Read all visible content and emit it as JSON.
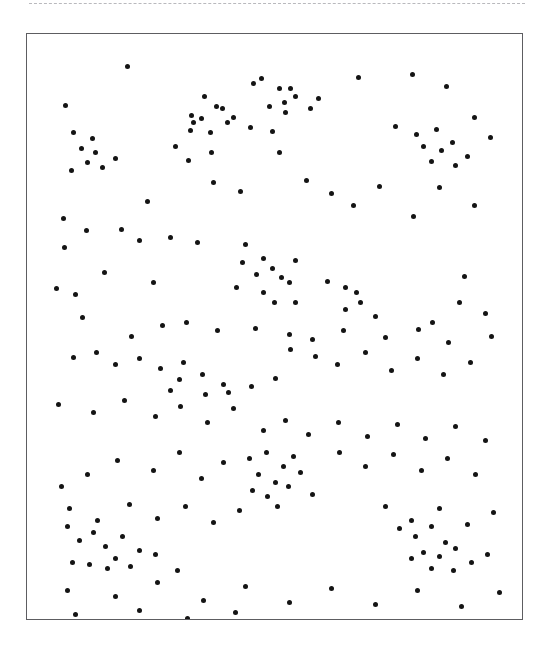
{
  "page": {
    "background_color": "#ffffff",
    "width": 552,
    "height": 663
  },
  "top_rule": {
    "style": "dashed",
    "color": "#b9b9bd"
  },
  "stimulus": {
    "title": "",
    "frame": {
      "x": 26,
      "y": 33,
      "width": 497,
      "height": 587,
      "border_color": "#5d5d61",
      "fill_color": "#ffffff"
    },
    "dot": {
      "color": "#141414",
      "diameter_px": 5,
      "shape": "circle"
    },
    "dot_count": 192
  },
  "chart_data": {
    "type": "scatter",
    "title": "",
    "xlabel": "",
    "ylabel": "",
    "xlim": [
      0,
      497
    ],
    "ylim": [
      0,
      587
    ],
    "grid": false,
    "legend": "none",
    "marker": "filled-circle",
    "marker_color": "#141414",
    "marker_size_px": 5,
    "note": "Coordinates are pixels relative to the inner top-left of the bordered frame; y increases downward.",
    "points": [
      [
        100,
        31
      ],
      [
        166,
        88
      ],
      [
        224,
        38
      ],
      [
        237,
        58
      ],
      [
        265,
        47
      ],
      [
        309,
        42
      ],
      [
        331,
        76
      ],
      [
        360,
        32
      ],
      [
        419,
        52
      ],
      [
        38,
        71
      ],
      [
        130,
        71
      ],
      [
        152,
        82
      ],
      [
        176,
        66
      ],
      [
        193,
        79
      ],
      [
        222,
        60
      ],
      [
        244,
        67
      ],
      [
        269,
        56
      ],
      [
        284,
        72
      ],
      [
        48,
        102
      ],
      [
        67,
        97
      ],
      [
        90,
        108
      ],
      [
        140,
        95
      ],
      [
        163,
        102
      ],
      [
        205,
        93
      ],
      [
        230,
        106
      ],
      [
        255,
        98
      ],
      [
        285,
        87
      ],
      [
        299,
        104
      ],
      [
        334,
        100
      ],
      [
        378,
        97
      ],
      [
        425,
        95
      ],
      [
        450,
        108
      ],
      [
        35,
        125
      ],
      [
        57,
        118
      ],
      [
        75,
        131
      ],
      [
        102,
        123
      ],
      [
        118,
        140
      ],
      [
        155,
        128
      ],
      [
        178,
        119
      ],
      [
        196,
        137
      ],
      [
        214,
        127
      ],
      [
        243,
        119
      ],
      [
        266,
        135
      ],
      [
        292,
        126
      ],
      [
        317,
        141
      ],
      [
        347,
        121
      ],
      [
        370,
        139
      ],
      [
        397,
        130
      ],
      [
        421,
        144
      ],
      [
        444,
        122
      ],
      [
        30,
        160
      ],
      [
        51,
        173
      ],
      [
        79,
        156
      ],
      [
        105,
        168
      ],
      [
        127,
        155
      ],
      [
        148,
        172
      ],
      [
        170,
        158
      ],
      [
        192,
        177
      ],
      [
        219,
        162
      ],
      [
        240,
        180
      ],
      [
        264,
        165
      ],
      [
        287,
        182
      ],
      [
        312,
        160
      ],
      [
        336,
        178
      ],
      [
        358,
        163
      ],
      [
        383,
        180
      ],
      [
        406,
        161
      ],
      [
        430,
        178
      ],
      [
        457,
        166
      ],
      [
        470,
        190
      ],
      [
        36,
        197
      ],
      [
        62,
        210
      ],
      [
        88,
        196
      ],
      [
        111,
        214
      ],
      [
        134,
        199
      ],
      [
        160,
        216
      ],
      [
        183,
        200
      ],
      [
        206,
        219
      ],
      [
        228,
        203
      ],
      [
        253,
        220
      ],
      [
        276,
        205
      ],
      [
        300,
        222
      ],
      [
        325,
        207
      ],
      [
        349,
        224
      ],
      [
        372,
        209
      ],
      [
        396,
        226
      ],
      [
        420,
        211
      ],
      [
        444,
        228
      ],
      [
        466,
        213
      ],
      [
        30,
        244
      ],
      [
        55,
        236
      ],
      [
        80,
        250
      ],
      [
        103,
        239
      ],
      [
        127,
        253
      ],
      [
        150,
        241
      ],
      [
        172,
        255
      ],
      [
        197,
        243
      ],
      [
        220,
        257
      ],
      [
        245,
        245
      ],
      [
        268,
        259
      ],
      [
        291,
        247
      ],
      [
        315,
        261
      ],
      [
        339,
        249
      ],
      [
        362,
        263
      ],
      [
        386,
        251
      ],
      [
        410,
        265
      ],
      [
        434,
        253
      ],
      [
        458,
        267
      ],
      [
        34,
        282
      ],
      [
        58,
        295
      ],
      [
        82,
        284
      ],
      [
        106,
        297
      ],
      [
        130,
        286
      ],
      [
        154,
        299
      ],
      [
        178,
        288
      ],
      [
        201,
        301
      ],
      [
        225,
        290
      ],
      [
        249,
        303
      ],
      [
        273,
        292
      ],
      [
        296,
        305
      ],
      [
        320,
        294
      ],
      [
        344,
        307
      ],
      [
        368,
        296
      ],
      [
        392,
        309
      ],
      [
        416,
        298
      ],
      [
        440,
        311
      ],
      [
        463,
        300
      ],
      [
        32,
        330
      ],
      [
        56,
        343
      ],
      [
        80,
        332
      ],
      [
        104,
        345
      ],
      [
        128,
        334
      ],
      [
        152,
        347
      ],
      [
        176,
        336
      ],
      [
        200,
        349
      ],
      [
        224,
        338
      ],
      [
        247,
        351
      ],
      [
        271,
        340
      ],
      [
        295,
        353
      ],
      [
        319,
        342
      ],
      [
        343,
        355
      ],
      [
        367,
        344
      ],
      [
        391,
        357
      ],
      [
        415,
        346
      ],
      [
        439,
        359
      ],
      [
        462,
        348
      ],
      [
        30,
        380
      ],
      [
        54,
        393
      ],
      [
        78,
        382
      ],
      [
        102,
        395
      ],
      [
        126,
        384
      ],
      [
        150,
        397
      ],
      [
        174,
        386
      ],
      [
        198,
        399
      ],
      [
        222,
        388
      ],
      [
        246,
        401
      ],
      [
        270,
        390
      ],
      [
        293,
        403
      ],
      [
        317,
        392
      ],
      [
        341,
        405
      ],
      [
        365,
        394
      ],
      [
        389,
        407
      ],
      [
        413,
        396
      ],
      [
        437,
        409
      ],
      [
        461,
        398
      ],
      [
        34,
        432
      ],
      [
        58,
        445
      ],
      [
        82,
        434
      ],
      [
        106,
        447
      ],
      [
        130,
        436
      ],
      [
        154,
        449
      ],
      [
        178,
        438
      ],
      [
        202,
        451
      ],
      [
        226,
        440
      ],
      [
        250,
        453
      ],
      [
        274,
        442
      ],
      [
        297,
        455
      ],
      [
        321,
        444
      ],
      [
        345,
        457
      ],
      [
        369,
        446
      ],
      [
        393,
        459
      ],
      [
        417,
        448
      ],
      [
        441,
        461
      ],
      [
        464,
        450
      ],
      [
        36,
        488
      ],
      [
        60,
        501
      ],
      [
        84,
        490
      ],
      [
        108,
        503
      ],
      [
        132,
        492
      ],
      [
        156,
        505
      ],
      [
        180,
        494
      ],
      [
        204,
        507
      ],
      [
        228,
        496
      ],
      [
        252,
        509
      ],
      [
        276,
        498
      ],
      [
        300,
        511
      ],
      [
        324,
        500
      ],
      [
        348,
        513
      ],
      [
        372,
        502
      ],
      [
        396,
        515
      ],
      [
        420,
        504
      ],
      [
        444,
        517
      ],
      [
        467,
        506
      ],
      [
        34,
        540
      ],
      [
        58,
        553
      ],
      [
        82,
        542
      ],
      [
        106,
        555
      ],
      [
        130,
        544
      ],
      [
        154,
        557
      ],
      [
        178,
        546
      ],
      [
        202,
        559
      ],
      [
        226,
        548
      ],
      [
        250,
        561
      ],
      [
        274,
        550
      ],
      [
        298,
        563
      ],
      [
        322,
        552
      ],
      [
        346,
        565
      ],
      [
        370,
        554
      ],
      [
        394,
        567
      ],
      [
        418,
        556
      ],
      [
        442,
        569
      ],
      [
        466,
        558
      ]
    ],
    "rendered_points": [
      [
        100,
        32
      ],
      [
        166,
        88
      ],
      [
        38,
        71
      ],
      [
        226,
        49
      ],
      [
        234,
        44
      ],
      [
        252,
        54
      ],
      [
        268,
        62
      ],
      [
        242,
        72
      ],
      [
        257,
        68
      ],
      [
        291,
        64
      ],
      [
        258,
        78
      ],
      [
        283,
        74
      ],
      [
        263,
        54
      ],
      [
        331,
        43
      ],
      [
        385,
        40
      ],
      [
        419,
        52
      ],
      [
        177,
        62
      ],
      [
        195,
        74
      ],
      [
        164,
        81
      ],
      [
        174,
        84
      ],
      [
        189,
        72
      ],
      [
        163,
        96
      ],
      [
        183,
        98
      ],
      [
        200,
        88
      ],
      [
        206,
        83
      ],
      [
        46,
        98
      ],
      [
        65,
        104
      ],
      [
        54,
        114
      ],
      [
        68,
        118
      ],
      [
        60,
        128
      ],
      [
        44,
        136
      ],
      [
        75,
        133
      ],
      [
        88,
        124
      ],
      [
        148,
        112
      ],
      [
        161,
        126
      ],
      [
        184,
        118
      ],
      [
        223,
        93
      ],
      [
        245,
        97
      ],
      [
        252,
        118
      ],
      [
        368,
        92
      ],
      [
        389,
        100
      ],
      [
        409,
        95
      ],
      [
        396,
        112
      ],
      [
        414,
        116
      ],
      [
        425,
        108
      ],
      [
        404,
        127
      ],
      [
        428,
        131
      ],
      [
        440,
        122
      ],
      [
        447,
        83
      ],
      [
        463,
        103
      ],
      [
        120,
        167
      ],
      [
        186,
        148
      ],
      [
        213,
        157
      ],
      [
        279,
        146
      ],
      [
        304,
        159
      ],
      [
        326,
        171
      ],
      [
        352,
        152
      ],
      [
        386,
        182
      ],
      [
        412,
        153
      ],
      [
        447,
        171
      ],
      [
        36,
        184
      ],
      [
        59,
        196
      ],
      [
        94,
        195
      ],
      [
        37,
        213
      ],
      [
        112,
        206
      ],
      [
        143,
        203
      ],
      [
        170,
        208
      ],
      [
        218,
        210
      ],
      [
        236,
        224
      ],
      [
        245,
        234
      ],
      [
        254,
        243
      ],
      [
        229,
        240
      ],
      [
        215,
        228
      ],
      [
        209,
        253
      ],
      [
        236,
        258
      ],
      [
        262,
        248
      ],
      [
        268,
        226
      ],
      [
        247,
        268
      ],
      [
        268,
        268
      ],
      [
        77,
        238
      ],
      [
        126,
        248
      ],
      [
        48,
        260
      ],
      [
        29,
        254
      ],
      [
        300,
        247
      ],
      [
        318,
        253
      ],
      [
        329,
        258
      ],
      [
        318,
        275
      ],
      [
        333,
        268
      ],
      [
        348,
        282
      ],
      [
        437,
        242
      ],
      [
        432,
        268
      ],
      [
        405,
        288
      ],
      [
        458,
        279
      ],
      [
        55,
        283
      ],
      [
        135,
        291
      ],
      [
        104,
        302
      ],
      [
        159,
        288
      ],
      [
        190,
        296
      ],
      [
        228,
        294
      ],
      [
        262,
        300
      ],
      [
        285,
        305
      ],
      [
        316,
        296
      ],
      [
        358,
        303
      ],
      [
        391,
        295
      ],
      [
        421,
        308
      ],
      [
        464,
        302
      ],
      [
        46,
        323
      ],
      [
        69,
        318
      ],
      [
        88,
        330
      ],
      [
        112,
        324
      ],
      [
        133,
        334
      ],
      [
        156,
        328
      ],
      [
        152,
        345
      ],
      [
        175,
        340
      ],
      [
        196,
        350
      ],
      [
        143,
        356
      ],
      [
        178,
        360
      ],
      [
        201,
        358
      ],
      [
        224,
        352
      ],
      [
        248,
        344
      ],
      [
        263,
        315
      ],
      [
        288,
        322
      ],
      [
        310,
        330
      ],
      [
        338,
        318
      ],
      [
        364,
        336
      ],
      [
        390,
        324
      ],
      [
        416,
        340
      ],
      [
        443,
        328
      ],
      [
        31,
        370
      ],
      [
        66,
        378
      ],
      [
        97,
        366
      ],
      [
        128,
        382
      ],
      [
        153,
        372
      ],
      [
        180,
        388
      ],
      [
        206,
        374
      ],
      [
        236,
        396
      ],
      [
        258,
        386
      ],
      [
        281,
        400
      ],
      [
        311,
        388
      ],
      [
        340,
        402
      ],
      [
        370,
        390
      ],
      [
        398,
        404
      ],
      [
        428,
        392
      ],
      [
        458,
        406
      ],
      [
        222,
        424
      ],
      [
        239,
        418
      ],
      [
        256,
        432
      ],
      [
        266,
        422
      ],
      [
        231,
        440
      ],
      [
        248,
        448
      ],
      [
        225,
        456
      ],
      [
        240,
        462
      ],
      [
        261,
        452
      ],
      [
        273,
        438
      ],
      [
        285,
        460
      ],
      [
        250,
        472
      ],
      [
        196,
        428
      ],
      [
        174,
        444
      ],
      [
        152,
        418
      ],
      [
        126,
        436
      ],
      [
        90,
        426
      ],
      [
        60,
        440
      ],
      [
        34,
        452
      ],
      [
        312,
        418
      ],
      [
        338,
        432
      ],
      [
        366,
        420
      ],
      [
        394,
        436
      ],
      [
        420,
        424
      ],
      [
        448,
        440
      ],
      [
        42,
        474
      ],
      [
        70,
        486
      ],
      [
        102,
        470
      ],
      [
        130,
        484
      ],
      [
        158,
        472
      ],
      [
        186,
        488
      ],
      [
        212,
        476
      ],
      [
        40,
        492
      ],
      [
        52,
        506
      ],
      [
        66,
        498
      ],
      [
        78,
        512
      ],
      [
        95,
        502
      ],
      [
        112,
        516
      ],
      [
        88,
        524
      ],
      [
        45,
        528
      ],
      [
        62,
        530
      ],
      [
        80,
        534
      ],
      [
        103,
        532
      ],
      [
        128,
        520
      ],
      [
        150,
        536
      ],
      [
        358,
        472
      ],
      [
        384,
        486
      ],
      [
        412,
        474
      ],
      [
        440,
        490
      ],
      [
        466,
        478
      ],
      [
        372,
        494
      ],
      [
        388,
        502
      ],
      [
        404,
        492
      ],
      [
        418,
        508
      ],
      [
        396,
        518
      ],
      [
        412,
        522
      ],
      [
        428,
        514
      ],
      [
        384,
        524
      ],
      [
        404,
        534
      ],
      [
        426,
        536
      ],
      [
        444,
        528
      ],
      [
        460,
        520
      ],
      [
        40,
        556
      ],
      [
        88,
        562
      ],
      [
        130,
        548
      ],
      [
        176,
        566
      ],
      [
        218,
        552
      ],
      [
        262,
        568
      ],
      [
        304,
        554
      ],
      [
        348,
        570
      ],
      [
        390,
        556
      ],
      [
        434,
        572
      ],
      [
        472,
        558
      ],
      [
        48,
        580
      ],
      [
        112,
        576
      ],
      [
        160,
        584
      ],
      [
        208,
        578
      ]
    ]
  }
}
